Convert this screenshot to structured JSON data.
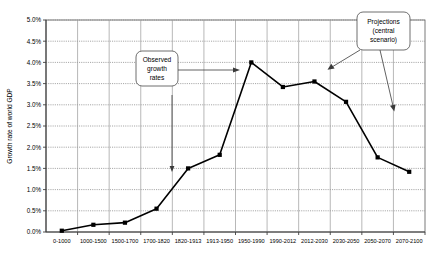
{
  "chart_data": {
    "type": "line",
    "title": "",
    "xlabel": "",
    "ylabel": "Growth rate of world GDP",
    "ylim": [
      0,
      5
    ],
    "yticks": [
      "0.0%",
      "0.5%",
      "1.0%",
      "1.5%",
      "2.0%",
      "2.5%",
      "3.0%",
      "3.5%",
      "4.0%",
      "4.5%",
      "5.0%"
    ],
    "grid": true,
    "legend": "none",
    "categories": [
      "0-1000",
      "1000-1500",
      "1500-1700",
      "1700-1820",
      "1820-1913",
      "1913-1950",
      "1950-1990",
      "1990-2012",
      "2012-2030",
      "2030-2050",
      "2050-2070",
      "2070-2100"
    ],
    "values": [
      0.03,
      0.17,
      0.22,
      0.55,
      1.5,
      1.82,
      4.0,
      3.42,
      3.55,
      3.07,
      1.76,
      1.42
    ],
    "series": [
      {
        "name": "Growth rate of world GDP",
        "values": [
          0.03,
          0.17,
          0.22,
          0.55,
          1.5,
          1.82,
          4.0,
          3.42,
          3.55,
          3.07,
          1.76,
          1.42
        ]
      }
    ],
    "annotations": [
      {
        "id": "observed",
        "text_lines": [
          "Observed",
          "growth",
          "rates"
        ],
        "points_to": [
          "1950-1990 peak",
          "1700-1820"
        ]
      },
      {
        "id": "projections",
        "text_lines": [
          "Projections",
          "(central",
          "scenario)"
        ],
        "points_to": [
          "2012-2030",
          "2050-2070"
        ]
      }
    ],
    "colors": {
      "line": "#000000",
      "marker": "#000000",
      "grid": "#808080",
      "axis": "#000000",
      "plot_background": "#ffffff"
    }
  }
}
